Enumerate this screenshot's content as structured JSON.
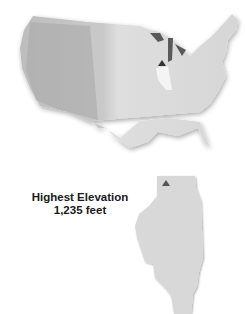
{
  "maps": {
    "us": {
      "region": "United States",
      "highlighted_state": "Illinois",
      "marker": "triangle"
    },
    "state": {
      "name": "Illinois",
      "marker": "triangle"
    }
  },
  "label": {
    "title": "Highest Elevation",
    "value": "1,235 feet"
  },
  "colors": {
    "land": "#d9d9d9",
    "highlight": "#f4f4f4",
    "marker": "#555555",
    "lakes": "#5a5a5a"
  }
}
